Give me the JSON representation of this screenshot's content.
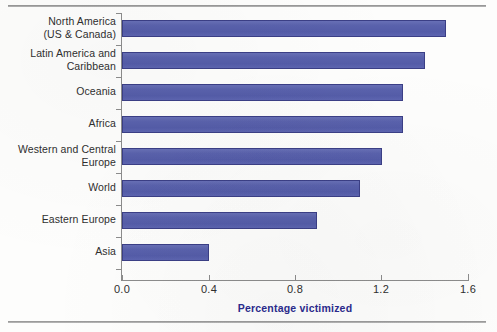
{
  "chart_data": {
    "type": "bar",
    "orientation": "horizontal",
    "title": "",
    "xlabel": "Percentage victimized",
    "ylabel": "",
    "xlim": [
      0.0,
      1.6
    ],
    "xticks": [
      "0.0",
      "0.4",
      "0.8",
      "1.2",
      "1.6"
    ],
    "xtick_values": [
      0.0,
      0.4,
      0.8,
      1.2,
      1.6
    ],
    "grid": false,
    "legend": false,
    "bar_color": "#555DA9",
    "bar_border_color": "#3B3F86",
    "axis_title_color": "#2B2B8E",
    "categories": [
      "North America\n(US & Canada)",
      "Latin America and\nCaribbean",
      "Oceania",
      "Africa",
      "Western and Central\nEurope",
      "World",
      "Eastern Europe",
      "Asia"
    ],
    "values": [
      1.5,
      1.4,
      1.3,
      1.3,
      1.2,
      1.1,
      0.9,
      0.4
    ]
  }
}
